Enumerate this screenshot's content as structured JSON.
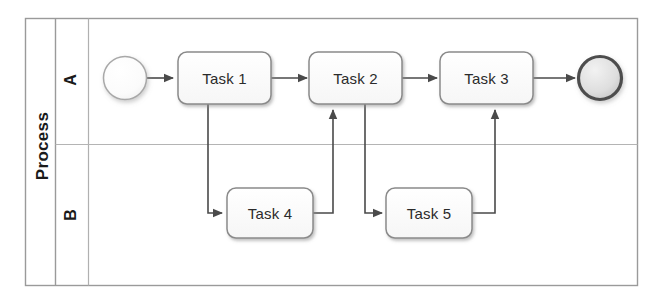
{
  "diagram": {
    "type": "bpmn-pool-lanes-flowchart",
    "pool": {
      "name": "pool-process",
      "title": "Process"
    },
    "lanes": [
      {
        "name": "lane-a",
        "label": "A"
      },
      {
        "name": "lane-b",
        "label": "B"
      }
    ],
    "events": [
      {
        "name": "start-event",
        "kind": "start",
        "lane": "A",
        "label": ""
      },
      {
        "name": "end-event",
        "kind": "end",
        "lane": "A",
        "label": ""
      }
    ],
    "tasks": [
      {
        "name": "task-1",
        "label": "Task 1",
        "lane": "A"
      },
      {
        "name": "task-2",
        "label": "Task 2",
        "lane": "A"
      },
      {
        "name": "task-3",
        "label": "Task 3",
        "lane": "A"
      },
      {
        "name": "task-4",
        "label": "Task 4",
        "lane": "B"
      },
      {
        "name": "task-5",
        "label": "Task 5",
        "lane": "B"
      }
    ],
    "flows": [
      {
        "name": "flow-start-to-task1",
        "from": "start-event",
        "to": "task-1"
      },
      {
        "name": "flow-task1-to-task2",
        "from": "task-1",
        "to": "task-2"
      },
      {
        "name": "flow-task2-to-task3",
        "from": "task-2",
        "to": "task-3"
      },
      {
        "name": "flow-task3-to-end",
        "from": "task-3",
        "to": "end-event"
      },
      {
        "name": "flow-task1-to-task4",
        "from": "task-1",
        "to": "task-4"
      },
      {
        "name": "flow-task4-to-task2",
        "from": "task-4",
        "to": "task-2"
      },
      {
        "name": "flow-task2-to-task5",
        "from": "task-2",
        "to": "task-5"
      },
      {
        "name": "flow-task5-to-task3",
        "from": "task-5",
        "to": "task-3"
      }
    ],
    "colors": {
      "stroke": "#555555",
      "frame": "#9a9a9a",
      "lane_divider": "#aaaaaa",
      "task_fill": "#fdfdfd",
      "start_fill": "#f7f7f7",
      "end_fill": "#dcdcdc",
      "text": "#2b2b2b",
      "background": "#ffffff"
    }
  }
}
